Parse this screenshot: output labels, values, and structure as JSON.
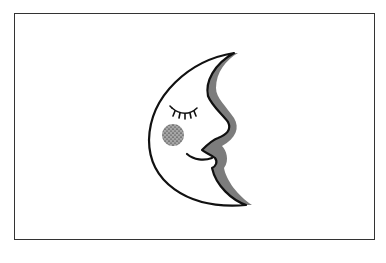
{
  "illustration": {
    "subject": "crescent moon with sleeping face",
    "style": "stipple ink drawing",
    "colors": {
      "ink": "#111111",
      "background": "#ffffff",
      "frame": "#333333"
    }
  }
}
